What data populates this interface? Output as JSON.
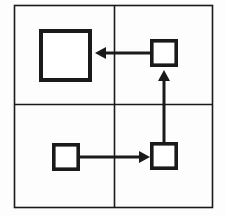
{
  "figure": {
    "kind": "quadrant-square-arrow-diagram",
    "background_color": "#fdfdfd",
    "stroke_color": "#1a1a1a",
    "fill_color": "#ffffff",
    "canvas": {
      "width": 226,
      "height": 215
    }
  },
  "frame": {
    "name": "outer-frame",
    "x": 14.5,
    "y": 5.5,
    "width": 198,
    "height": 202,
    "stroke_width": 1.6
  },
  "grid": {
    "name": "quadrant-divider-cross",
    "vertical_x": 114.5,
    "horizontal_y": 104.5,
    "stroke_width": 1.6,
    "quadrants": [
      {
        "id": "top-left",
        "label": ""
      },
      {
        "id": "top-right",
        "label": ""
      },
      {
        "id": "bottom-left",
        "label": ""
      },
      {
        "id": "bottom-right",
        "label": ""
      }
    ]
  },
  "squares": [
    {
      "id": "large-square",
      "quadrant": "top-left",
      "x": 39,
      "y": 29,
      "size": 53,
      "stroke_width": 4,
      "label": ""
    },
    {
      "id": "top-right-square",
      "quadrant": "top-right",
      "x": 150,
      "y": 39,
      "size": 28,
      "stroke_width": 3.6,
      "label": ""
    },
    {
      "id": "bottom-left-square",
      "quadrant": "bottom-left",
      "x": 52,
      "y": 143,
      "size": 28,
      "stroke_width": 3.6,
      "label": ""
    },
    {
      "id": "bottom-right-square",
      "quadrant": "bottom-right",
      "x": 150,
      "y": 142,
      "size": 28,
      "stroke_width": 3.6,
      "label": ""
    }
  ],
  "arrows": [
    {
      "id": "arrow-top-right-to-large",
      "direction": "left",
      "from": "top-right-square",
      "to": "large-square",
      "x1": 150,
      "y1": 53,
      "x2": 95,
      "y2": 53,
      "stroke_width": 3,
      "head_length": 11,
      "head_half_width": 6,
      "label": ""
    },
    {
      "id": "arrow-bottom-right-to-top-right",
      "direction": "up",
      "from": "bottom-right-square",
      "to": "top-right-square",
      "x1": 164,
      "y1": 142,
      "x2": 164,
      "y2": 70,
      "stroke_width": 3,
      "head_length": 11,
      "head_half_width": 6,
      "label": ""
    },
    {
      "id": "arrow-bottom-left-to-bottom-right",
      "direction": "right",
      "from": "bottom-left-square",
      "to": "bottom-right-square",
      "x1": 80,
      "y1": 157,
      "x2": 150,
      "y2": 157,
      "stroke_width": 3,
      "head_length": 11,
      "head_half_width": 6,
      "label": ""
    }
  ]
}
